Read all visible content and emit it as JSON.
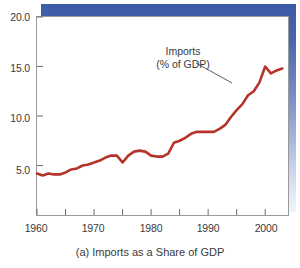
{
  "chart_data": {
    "type": "line",
    "title": "",
    "caption": "(a) Imports as a Share of GDP",
    "xlabel": "",
    "ylabel": "",
    "ylim": [
      0,
      20
    ],
    "xlim": [
      1960,
      2004
    ],
    "grid": false,
    "legend_position": "inline-annotation",
    "annotations": [
      {
        "text_line1": "Imports",
        "text_line2": "(% of GDP)",
        "points_to_year": 1996
      }
    ],
    "y_ticks": [
      5.0,
      10.0,
      15.0,
      20.0
    ],
    "y_tick_labels": [
      "5.0",
      "10.0",
      "15.0",
      "20.0"
    ],
    "x_ticks": [
      1960,
      1965,
      1970,
      1975,
      1980,
      1985,
      1990,
      1995,
      2000
    ],
    "x_tick_labels": [
      "1960",
      "",
      "1970",
      "",
      "1980",
      "",
      "1990",
      "",
      "2000"
    ],
    "x_major_labels": [
      "1960",
      "1970",
      "1980",
      "1990",
      "2000"
    ],
    "series": [
      {
        "name": "Imports (% of GDP)",
        "color": "#b5342a",
        "x": [
          1960,
          1961,
          1962,
          1963,
          1964,
          1965,
          1966,
          1967,
          1968,
          1969,
          1970,
          1971,
          1972,
          1973,
          1974,
          1975,
          1976,
          1977,
          1978,
          1979,
          1980,
          1981,
          1982,
          1983,
          1984,
          1985,
          1986,
          1987,
          1988,
          1989,
          1990,
          1991,
          1992,
          1993,
          1994,
          1995,
          1996,
          1997,
          1998,
          1999,
          2000,
          2001,
          2002,
          2003
        ],
        "values": [
          4.2,
          4.0,
          4.2,
          4.1,
          4.1,
          4.3,
          4.6,
          4.7,
          5.0,
          5.1,
          5.3,
          5.5,
          5.8,
          6.0,
          6.0,
          5.3,
          6.0,
          6.4,
          6.5,
          6.4,
          6.0,
          5.9,
          5.9,
          6.2,
          7.3,
          7.5,
          7.8,
          8.2,
          8.4,
          8.4,
          8.4,
          8.4,
          8.7,
          9.1,
          9.9,
          10.6,
          11.2,
          12.1,
          12.5,
          13.4,
          15.0,
          14.3,
          14.6,
          14.8
        ]
      }
    ]
  },
  "axis": {
    "y_labels": [
      "20.0",
      "15.0",
      "10.0",
      "5.0"
    ],
    "x_labels": [
      "1960",
      "1970",
      "1980",
      "1990",
      "2000"
    ]
  },
  "annotation": {
    "line1": "Imports",
    "line2": "(% of GDP)"
  },
  "caption": {
    "text": "(a) Imports as a Share of GDP"
  },
  "colors": {
    "series_line": "#b5342a",
    "shadow_blue": "#3d5aa8",
    "axis": "#9a9a9a",
    "text": "#3a3a3a"
  }
}
